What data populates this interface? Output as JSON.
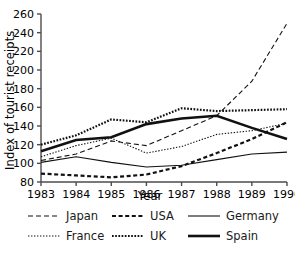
{
  "chart_data": {
    "type": "line",
    "title": "",
    "xlabel": "Year",
    "ylabel": "Index of tourist receipts",
    "x": [
      1983,
      1984,
      1985,
      1986,
      1987,
      1988,
      1989,
      1990
    ],
    "xtick_labels": [
      "1983",
      "1984",
      "1985",
      "1986",
      "1987",
      "1988",
      "1989",
      "1990"
    ],
    "ytick_labels": [
      "80",
      "100",
      "120",
      "140",
      "160",
      "180",
      "200",
      "220",
      "240",
      "260"
    ],
    "ytick_values": [
      80,
      100,
      120,
      140,
      160,
      180,
      200,
      220,
      240,
      260
    ],
    "xlim": [
      1983,
      1990
    ],
    "ylim": [
      80,
      260
    ],
    "grid": false,
    "legend_position": "below",
    "series": [
      {
        "name": "Japan",
        "style": "dashed-thin",
        "values": [
          103,
          110,
          124,
          119,
          135,
          151,
          188,
          250
        ]
      },
      {
        "name": "USA",
        "style": "dashed-thick",
        "values": [
          89,
          87,
          85,
          88,
          97,
          111,
          126,
          144
        ]
      },
      {
        "name": "Germany",
        "style": "solid-thin",
        "values": [
          101,
          107,
          101,
          96,
          98,
          104,
          110,
          112
        ]
      },
      {
        "name": "France",
        "style": "dotted-thin",
        "values": [
          107,
          119,
          127,
          111,
          118,
          131,
          135,
          143
        ]
      },
      {
        "name": "UK",
        "style": "dotted-thick",
        "values": [
          120,
          130,
          147,
          144,
          159,
          156,
          157,
          158
        ]
      },
      {
        "name": "Spain",
        "style": "solid-thick",
        "values": [
          113,
          125,
          128,
          142,
          148,
          151,
          138,
          126
        ]
      }
    ]
  },
  "legend": {
    "rows": [
      [
        {
          "label": "Japan",
          "series": "Japan"
        },
        {
          "label": "USA",
          "series": "USA"
        },
        {
          "label": "Germany",
          "series": "Germany"
        }
      ],
      [
        {
          "label": "France",
          "series": "France"
        },
        {
          "label": "UK",
          "series": "UK"
        },
        {
          "label": "Spain",
          "series": "Spain"
        }
      ]
    ]
  }
}
